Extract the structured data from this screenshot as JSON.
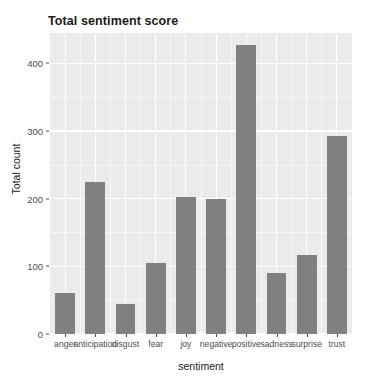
{
  "chart_data": {
    "type": "bar",
    "title": "Total sentiment score",
    "xlabel": "sentiment",
    "ylabel": "Total count",
    "categories": [
      "anger",
      "anticipation",
      "disgust",
      "fear",
      "joy",
      "negative",
      "positive",
      "sadness",
      "surprise",
      "trust"
    ],
    "values": [
      60,
      225,
      45,
      105,
      203,
      199,
      428,
      90,
      117,
      293
    ],
    "ylim": [
      0,
      445
    ],
    "y_ticks": [
      0,
      100,
      200,
      300,
      400
    ],
    "y_tick_labels": [
      "0",
      "100",
      "200",
      "300",
      "400"
    ],
    "y_minor_ticks": [
      50,
      150,
      250,
      350,
      400
    ],
    "grid": true,
    "legend": "none",
    "bar_color": "#808080",
    "panel_color": "#ebebeb",
    "grid_color": "#ffffff",
    "text_color": "#1a1a1a",
    "tick_color": "#4d4d4d"
  }
}
